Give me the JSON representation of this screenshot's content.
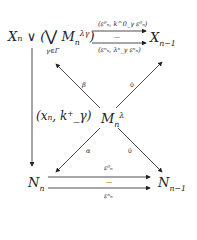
{
  "diagram": {
    "nodes": {
      "top_left": "Xₙ ∨ (⋁ Mₙ^λγ)",
      "top_left_main": "Xₙ ∨ (",
      "top_left_big_vee": "⋁",
      "top_left_M": "M",
      "top_left_M_sub": "n",
      "top_left_M_sup": "λγ",
      "top_left_close": ")",
      "top_left_index": "γ∈Γ",
      "top_right": "Xₙ₋₁",
      "top_right_main": "X",
      "top_right_sub": "n−1",
      "center": "Mₙ^λ",
      "center_main": "M",
      "center_sub": "n",
      "center_sup": "λ",
      "bottom_left": "Nₙ",
      "bottom_left_main": "N",
      "bottom_left_sub": "n",
      "bottom_right": "Nₙ₋₁",
      "bottom_right_main": "N",
      "bottom_right_sub": "n−1"
    },
    "edges": {
      "top_upper_label": "(ε⁰ₙ, k^0_γ ε⁰ₙ)",
      "top_dots": "⋯",
      "top_lower_label": "(εⁿₙ, λⁿ_γ εⁿₙ)",
      "left_vertical_label": "(xₙ, k⁺_γ)",
      "beta_label": "β",
      "center_to_topright_label": "0",
      "alpha_label": "α",
      "center_to_bottomright_label": "0",
      "bottom_upper_label": "ε⁰ₙ",
      "bottom_dots": "⋯",
      "bottom_lower_label": "εⁿₙ"
    }
  }
}
